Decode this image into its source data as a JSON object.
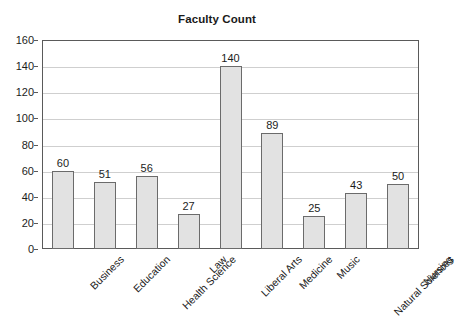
{
  "chart_data": {
    "type": "bar",
    "title": "Faculty Count",
    "xlabel": "",
    "ylabel": "",
    "categories": [
      "Business",
      "Education",
      "Health Science",
      "Law",
      "Liberal Arts",
      "Medicine",
      "Music",
      "Natural Sciences",
      "Nursing"
    ],
    "values": [
      60,
      51,
      56,
      27,
      140,
      89,
      25,
      43,
      50
    ],
    "value_labels": [
      "60",
      "51",
      "56",
      "27",
      "140",
      "89",
      "25",
      "43",
      "50"
    ],
    "ylim": [
      0,
      160
    ],
    "ytick_values": [
      0,
      20,
      40,
      60,
      80,
      100,
      120,
      140,
      160
    ],
    "ytick_labels": [
      "0",
      "20",
      "40",
      "60",
      "80",
      "100",
      "120",
      "140",
      "160"
    ],
    "grid": true,
    "grid_axis": "y",
    "legend": false,
    "legend_position": "none",
    "bar_fill_color": "#e2e2e2",
    "bar_border_color": "#6b6b6b",
    "gridline_color": "#cfcfcf",
    "axis_color": "#5a5a5a",
    "background_color": "#ffffff",
    "text_color": "#1c1c1c",
    "xtick_label_rotation": -45
  }
}
